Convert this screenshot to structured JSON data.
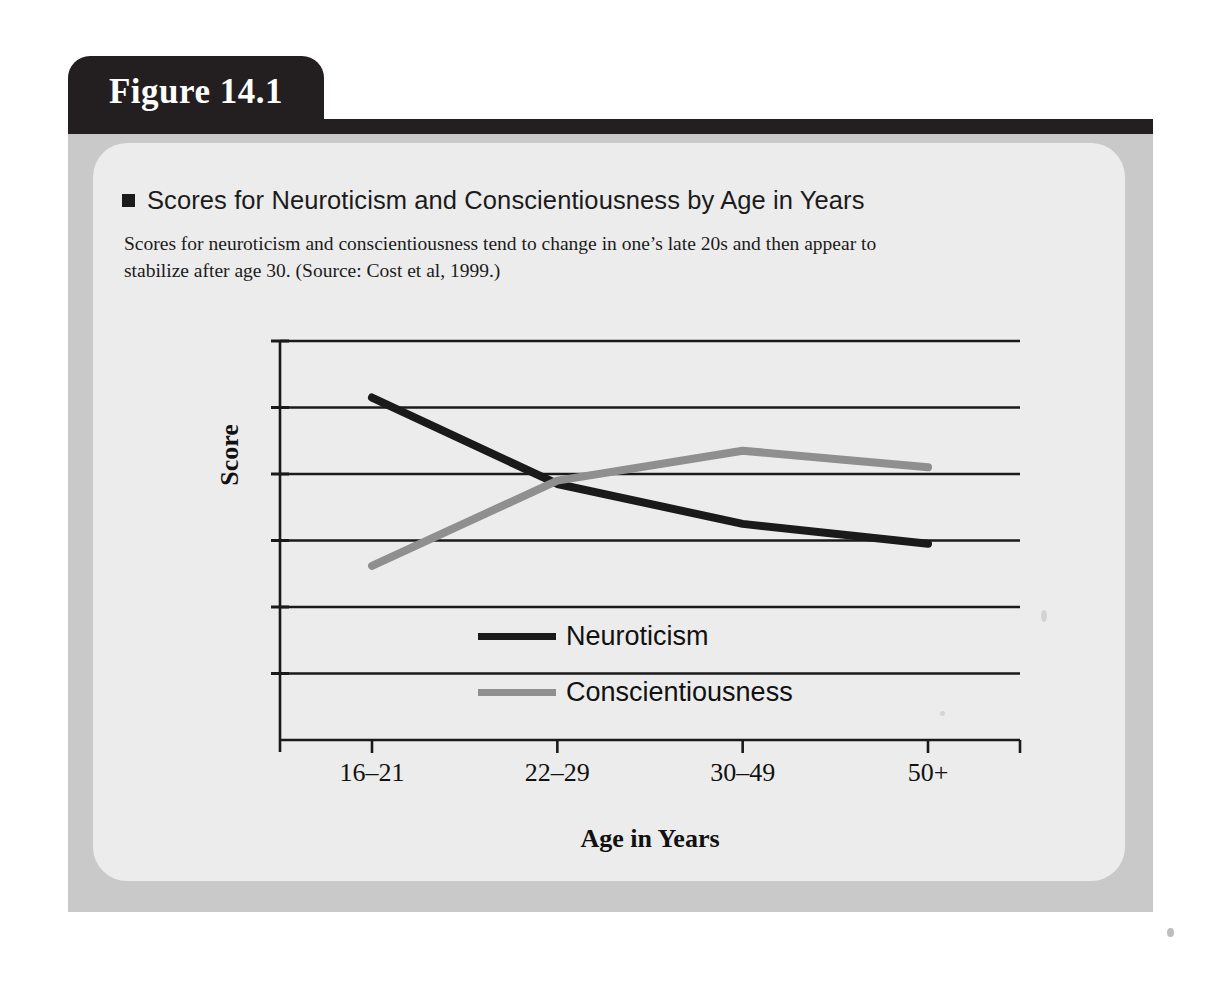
{
  "figure": {
    "tab_label": "Figure 14.1",
    "title": "Scores for Neuroticism and Conscientiousness by Age in Years",
    "caption": "Scores for neuroticism and conscientiousness tend to change in one’s late 20s and then appear to stabilize after age 30. (Source: Cost et al, 1999.)",
    "bullet_icon": "square-bullet-icon"
  },
  "colors": {
    "tab_background": "#231f20",
    "tab_text": "#ffffff",
    "outer_panel": "#c9c9c9",
    "inner_panel": "#ececec",
    "neuroticism_line": "#1a1a1a",
    "conscientiousness_line": "#8f8f8f",
    "axis": "#1a1a1a",
    "gridline": "#1a1a1a"
  },
  "chart_data": {
    "type": "line",
    "title": "Scores for Neuroticism and Conscientiousness by Age in Years",
    "xlabel": "Age in Years",
    "ylabel": "Score",
    "categories": [
      "16–21",
      "22–29",
      "30–49",
      "50+"
    ],
    "series": [
      {
        "name": "Neuroticism",
        "color": "#1a1a1a",
        "values": [
          5.15,
          3.85,
          3.25,
          2.95
        ]
      },
      {
        "name": "Conscientiousness",
        "color": "#8f8f8f",
        "values": [
          2.62,
          3.9,
          4.35,
          4.1
        ]
      }
    ],
    "ylim": [
      0,
      6
    ],
    "yticks": [
      0,
      1,
      2,
      3,
      4,
      5,
      6
    ],
    "ytick_labels": [
      "",
      "",
      "",
      "",
      "",
      "",
      ""
    ],
    "grid": true,
    "legend_position": "inside-bottom-center",
    "legend": [
      "Neuroticism",
      "Conscientiousness"
    ]
  }
}
